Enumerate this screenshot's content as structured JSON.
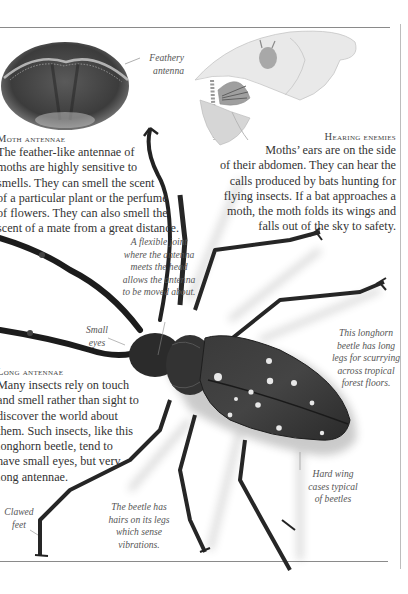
{
  "page": {
    "type": "illustrated book page",
    "topic": "Insect senses — antennae and hearing"
  },
  "sections": {
    "moth_antennae": {
      "heading": "Moth antennae",
      "lines": [
        "The feather-like antennae of",
        "moths are highly sensitive to",
        "smells. They can smell the scent",
        "of a particular plant or the perfume",
        "of flowers. They can also smell the",
        "scent of a mate from a great distance."
      ]
    },
    "hearing_enemies": {
      "heading": "Hearing enemies",
      "lines": [
        "Moths’ ears are on the side",
        "of their abdomen. They can hear the",
        "calls produced by bats hunting for",
        "flying insects. If a bat approaches a",
        "moth, the moth folds its wings and",
        "falls out of the sky to safety."
      ]
    },
    "long_antennae": {
      "heading": "Long antennae",
      "lines": [
        "Many insects rely on touch",
        "and smell rather than sight to",
        "discover the world about",
        "them. Such insects, like this",
        "longhorn beetle, tend to",
        "have small eyes, but very",
        "long antennae."
      ]
    }
  },
  "captions": {
    "feathery": [
      "Feathery",
      "antenna"
    ],
    "joint": [
      "A flexible joint",
      "where the antenna",
      "meets the head",
      "allows the antenna",
      "to be moved about."
    ],
    "eyes": [
      "Small",
      "eyes"
    ],
    "longhorn": [
      "This longhorn",
      "beetle has long",
      "legs for scurrying",
      "across tropical",
      "forest floors."
    ],
    "hardwing": [
      "Hard wing",
      "cases typical",
      "of beetles"
    ],
    "hairs": [
      "The beetle has",
      "hairs on its legs",
      "which sense",
      "vibrations."
    ],
    "clawed": [
      "Clawed",
      "feet"
    ]
  },
  "illustrations": {
    "moth_head_photo": "moth head with feathery antennae (oval vignette)",
    "bat_and_moth_drawing": "pencil drawing of bat chasing a moth",
    "longhorn_beetle_photo": "spotted longhorn beetle, top view"
  }
}
